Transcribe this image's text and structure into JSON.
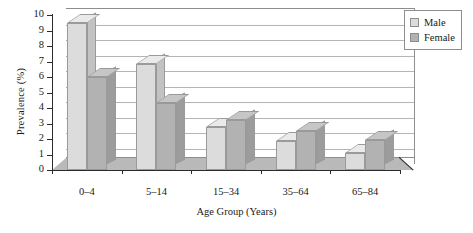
{
  "chart_data": {
    "type": "bar",
    "title": "",
    "xlabel": "Age Group (Years)",
    "ylabel": "Prevalence (%)",
    "categories": [
      "0–4",
      "5–14",
      "15–34",
      "35–64",
      "65–84"
    ],
    "series": [
      {
        "name": "Male",
        "color": "#dcdcdc",
        "values": [
          9.5,
          6.85,
          2.8,
          1.85,
          1.1
        ]
      },
      {
        "name": "Female",
        "color": "#b2b2b2",
        "values": [
          6.0,
          4.3,
          3.2,
          2.5,
          1.95
        ]
      }
    ],
    "ylim": [
      0,
      10
    ],
    "yticks": [
      0,
      1,
      2,
      3,
      4,
      5,
      6,
      7,
      8,
      9,
      10
    ],
    "ytick_labels": [
      "0",
      "1",
      "2",
      "3",
      "4",
      "5",
      "6",
      "7",
      "8",
      "9",
      "10"
    ],
    "grid": true,
    "grid_axis": "y",
    "legend_position": "top-right",
    "three_d": true,
    "bar_style": "grouped"
  },
  "legend": {
    "entries": [
      {
        "label": "Male"
      },
      {
        "label": "Female"
      }
    ]
  },
  "axes": {
    "y_title": "Prevalence (%)",
    "x_title": "Age Group (Years)"
  }
}
